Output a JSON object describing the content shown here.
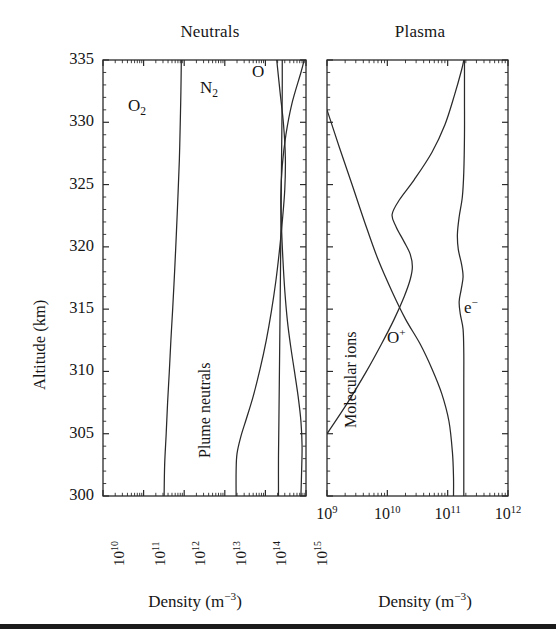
{
  "figure": {
    "y_axis_label": "Altitude (km)",
    "y_ticks": [
      "335",
      "330",
      "325",
      "320",
      "315",
      "310",
      "305",
      "300"
    ],
    "axis_caption_left": "Density (m",
    "axis_caption_left_sup": "−3",
    "axis_caption_left_tail": ")",
    "axis_caption_right": "Density (m",
    "axis_caption_right_sup": "−3",
    "axis_caption_right_tail": ")"
  },
  "panels": {
    "left": {
      "title": "Neutrals",
      "x_caption": "Density (m−3)",
      "x_ticks": [
        {
          "mantissa": "10",
          "exp": "10"
        },
        {
          "mantissa": "10",
          "exp": "11"
        },
        {
          "mantissa": "10",
          "exp": "12"
        },
        {
          "mantissa": "10",
          "exp": "13"
        },
        {
          "mantissa": "10",
          "exp": "14"
        },
        {
          "mantissa": "10",
          "exp": "15"
        }
      ],
      "curve_labels": {
        "o2": "O",
        "o2_sub": "2",
        "n2": "N",
        "n2_sub": "2",
        "o": "O",
        "plume": "Plume neutrals"
      }
    },
    "right": {
      "title": "Plasma",
      "x_caption": "Density (m−3)",
      "x_ticks": [
        {
          "mantissa": "10",
          "exp": "9"
        },
        {
          "mantissa": "10",
          "exp": "10"
        },
        {
          "mantissa": "10",
          "exp": "11"
        },
        {
          "mantissa": "10",
          "exp": "12"
        }
      ],
      "curve_labels": {
        "o_plus": "O",
        "o_plus_sup": "+",
        "electron": "e",
        "electron_sup": "−",
        "molecular": "Molecular ions"
      }
    }
  },
  "chart_data": [
    {
      "type": "line",
      "title": "Neutrals",
      "xlabel": "Density (m^-3)",
      "ylabel": "Altitude (km)",
      "xscale": "log",
      "xlim": [
        10000000000.0,
        1000000000000000.0
      ],
      "ylim": [
        300,
        335
      ],
      "grid": false,
      "legend": "inline-curve-labels",
      "series": [
        {
          "name": "O2",
          "points": [
            [
              320000000000.0,
              300.0
            ],
            [
              330000000000.0,
              302.5
            ],
            [
              360000000000.0,
              305.0
            ],
            [
              390000000000.0,
              307.5
            ],
            [
              430000000000.0,
              310.0
            ],
            [
              470000000000.0,
              312.5
            ],
            [
              520000000000.0,
              315.0
            ],
            [
              580000000000.0,
              318.0
            ],
            [
              640000000000.0,
              321.0
            ],
            [
              700000000000.0,
              324.0
            ],
            [
              760000000000.0,
              327.0
            ],
            [
              800000000000.0,
              330.0
            ],
            [
              830000000000.0,
              332.5
            ],
            [
              850000000000.0,
              335.0
            ]
          ]
        },
        {
          "name": "N2",
          "points": [
            [
              19000000000000.0,
              300.0
            ],
            [
              19000000000000.0,
              302.0
            ],
            [
              20000000000000.0,
              303.4
            ],
            [
              25000000000000.0,
              304.8
            ],
            [
              34000000000000.0,
              306.2
            ],
            [
              50000000000000.0,
              308.0
            ],
            [
              74000000000000.0,
              310.2
            ],
            [
              105000000000000.0,
              312.5
            ],
            [
              140000000000000.0,
              314.8
            ],
            [
              180000000000000.0,
              317.2
            ],
            [
              220000000000000.0,
              319.6
            ],
            [
              260000000000000.0,
              322.0
            ],
            [
              300000000000000.0,
              324.6
            ],
            [
              310000000000000.0,
              327.2
            ],
            [
              280000000000000.0,
              329.8
            ],
            [
              230000000000000.0,
              332.4
            ],
            [
              190000000000000.0,
              335.0
            ]
          ]
        },
        {
          "name": "O",
          "points": [
            [
              210000000000000.0,
              300.0
            ],
            [
              210000000000000.0,
              303.0
            ],
            [
              215000000000000.0,
              306.0
            ],
            [
              220000000000000.0,
              309.0
            ],
            [
              225000000000000.0,
              312.0
            ],
            [
              230000000000000.0,
              315.0
            ],
            [
              235000000000000.0,
              318.0
            ],
            [
              240000000000000.0,
              321.0
            ],
            [
              245000000000000.0,
              324.0
            ],
            [
              250000000000000.0,
              327.0
            ],
            [
              255000000000000.0,
              330.0
            ],
            [
              260000000000000.0,
              332.5
            ],
            [
              260000000000000.0,
              335.0
            ]
          ]
        },
        {
          "name": "Plume neutrals",
          "points": [
            [
              750000000000000.0,
              300.0
            ],
            [
              780000000000000.0,
              302.0
            ],
            [
              800000000000000.0,
              304.0
            ],
            [
              750000000000000.0,
              306.0
            ],
            [
              640000000000000.0,
              308.0
            ],
            [
              520000000000000.0,
              310.0
            ],
            [
              420000000000000.0,
              312.0
            ],
            [
              350000000000000.0,
              314.0
            ],
            [
              300000000000000.0,
              316.5
            ],
            [
              270000000000000.0,
              319.0
            ],
            [
              250000000000000.0,
              321.5
            ],
            [
              240000000000000.0,
              324.0
            ],
            [
              260000000000000.0,
              326.5
            ],
            [
              320000000000000.0,
              329.0
            ],
            [
              450000000000000.0,
              331.5
            ],
            [
              750000000000000.0,
              334.0
            ],
            [
              900000000000000.0,
              335.0
            ]
          ]
        }
      ]
    },
    {
      "type": "line",
      "title": "Plasma",
      "xlabel": "Density (m^-3)",
      "ylabel": "Altitude (km)",
      "xscale": "log",
      "xlim": [
        1000000000.0,
        1000000000000.0
      ],
      "ylim": [
        300,
        335
      ],
      "grid": false,
      "legend": "inline-curve-labels",
      "series": [
        {
          "name": "Molecular ions",
          "points": [
            [
              1000000000.0,
              331.0
            ],
            [
              1600000000.0,
              328.0
            ],
            [
              2600000000.0,
              325.0
            ],
            [
              4200000000.0,
              322.0
            ],
            [
              7000000000.0,
              319.0
            ],
            [
              12000000000.0,
              316.4
            ],
            [
              20000000000.0,
              314.2
            ],
            [
              35000000000.0,
              312.2
            ],
            [
              55000000000.0,
              310.2
            ],
            [
              80000000000.0,
              308.2
            ],
            [
              105000000000.0,
              306.0
            ],
            [
              120000000000.0,
              303.5
            ],
            [
              125000000000.0,
              301.5
            ],
            [
              125000000000.0,
              300.0
            ]
          ]
        },
        {
          "name": "O+",
          "points": [
            [
              1000000000.0,
              305.0
            ],
            [
              2200000000.0,
              307.5
            ],
            [
              4500000000.0,
              310.0
            ],
            [
              8000000000.0,
              312.2
            ],
            [
              13000000000.0,
              314.2
            ],
            [
              19000000000.0,
              316.0
            ],
            [
              24000000000.0,
              317.4
            ],
            [
              26000000000.0,
              318.4
            ],
            [
              24000000000.0,
              319.4
            ],
            [
              19000000000.0,
              320.4
            ],
            [
              14000000000.0,
              321.6
            ],
            [
              12000000000.0,
              322.6
            ],
            [
              16000000000.0,
              323.8
            ],
            [
              28000000000.0,
              325.4
            ],
            [
              55000000000.0,
              327.6
            ],
            [
              90000000000.0,
              329.8
            ],
            [
              130000000000.0,
              332.2
            ],
            [
              170000000000.0,
              334.2
            ],
            [
              185000000000.0,
              335.0
            ]
          ]
        },
        {
          "name": "e-",
          "points": [
            [
              185000000000.0,
              300.0
            ],
            [
              185000000000.0,
              303.0
            ],
            [
              185000000000.0,
              306.0
            ],
            [
              185000000000.0,
              309.0
            ],
            [
              185000000000.0,
              311.5
            ],
            [
              180000000000.0,
              313.4
            ],
            [
              162000000000.0,
              314.6
            ],
            [
              155000000000.0,
              315.6
            ],
            [
              168000000000.0,
              316.6
            ],
            [
              180000000000.0,
              317.6
            ],
            [
              170000000000.0,
              318.6
            ],
            [
              150000000000.0,
              319.8
            ],
            [
              145000000000.0,
              321.0
            ],
            [
              155000000000.0,
              322.4
            ],
            [
              175000000000.0,
              324.0
            ],
            [
              185000000000.0,
              326.0
            ],
            [
              190000000000.0,
              329.0
            ],
            [
              190000000000.0,
              332.0
            ],
            [
              190000000000.0,
              335.0
            ]
          ]
        }
      ]
    }
  ]
}
